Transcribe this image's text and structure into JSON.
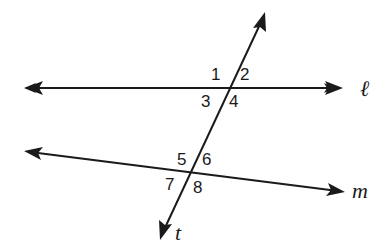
{
  "diagram": {
    "type": "parallel-lines-cut-by-transversal",
    "lines": {
      "l": {
        "label": "ℓ"
      },
      "m": {
        "label": "m"
      },
      "t": {
        "label": "t"
      }
    },
    "angles": [
      "1",
      "2",
      "3",
      "4",
      "5",
      "6",
      "7",
      "8"
    ],
    "colors": {
      "stroke": "#1a1a1a",
      "background": "#ffffff"
    }
  }
}
